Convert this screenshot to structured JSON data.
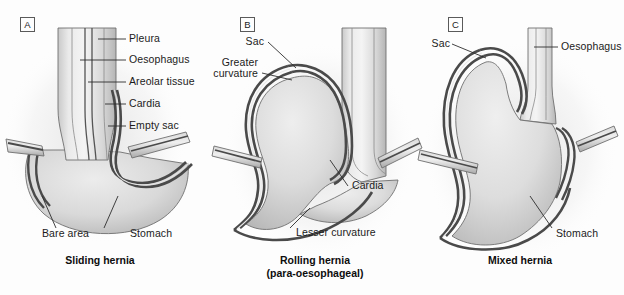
{
  "figure": {
    "background_color": "#fdfdfd",
    "line_color": "#3a3a3a",
    "text_color": "#1b1b1b"
  },
  "panels": [
    {
      "letter": "A",
      "caption_line1": "Sliding hernia",
      "caption_line2": "",
      "labels": [
        {
          "text": "Pleura"
        },
        {
          "text": "Oesophagus"
        },
        {
          "text": "Areolar tissue"
        },
        {
          "text": "Cardia"
        },
        {
          "text": "Empty sac"
        },
        {
          "text": "Bare area"
        },
        {
          "text": "Stomach"
        }
      ]
    },
    {
      "letter": "B",
      "caption_line1": "Rolling hernia",
      "caption_line2": "(para-oesophageal)",
      "labels": [
        {
          "text": "Sac"
        },
        {
          "text": "Greater"
        },
        {
          "text": "curvature"
        },
        {
          "text": "Cardia"
        },
        {
          "text": "Lesser curvature"
        }
      ]
    },
    {
      "letter": "C",
      "caption_line1": "Mixed hernia",
      "caption_line2": "",
      "labels": [
        {
          "text": "Sac"
        },
        {
          "text": "Oesophagus"
        },
        {
          "text": "Stomach"
        }
      ]
    }
  ]
}
